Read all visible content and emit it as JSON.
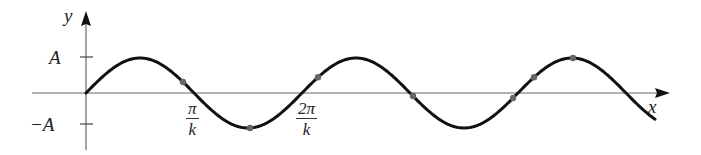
{
  "figure": {
    "axes": {
      "x_label": "x",
      "y_label": "y",
      "y_ticks": [
        {
          "label": "A",
          "value": "A"
        },
        {
          "label": "−A",
          "value": "-A"
        }
      ],
      "x_ticks": [
        {
          "numerator": "π",
          "denominator": "k"
        },
        {
          "numerator": "2π",
          "denominator": "k"
        }
      ]
    },
    "curve": {
      "function": "A sin(kx)",
      "x_range_in_periods": [
        0,
        2.62
      ],
      "color": "#111111"
    },
    "marked_points_count": 7,
    "colors": {
      "axis": "#555555",
      "curve": "#111111",
      "points": "#666666",
      "background": "#ffffff"
    }
  }
}
